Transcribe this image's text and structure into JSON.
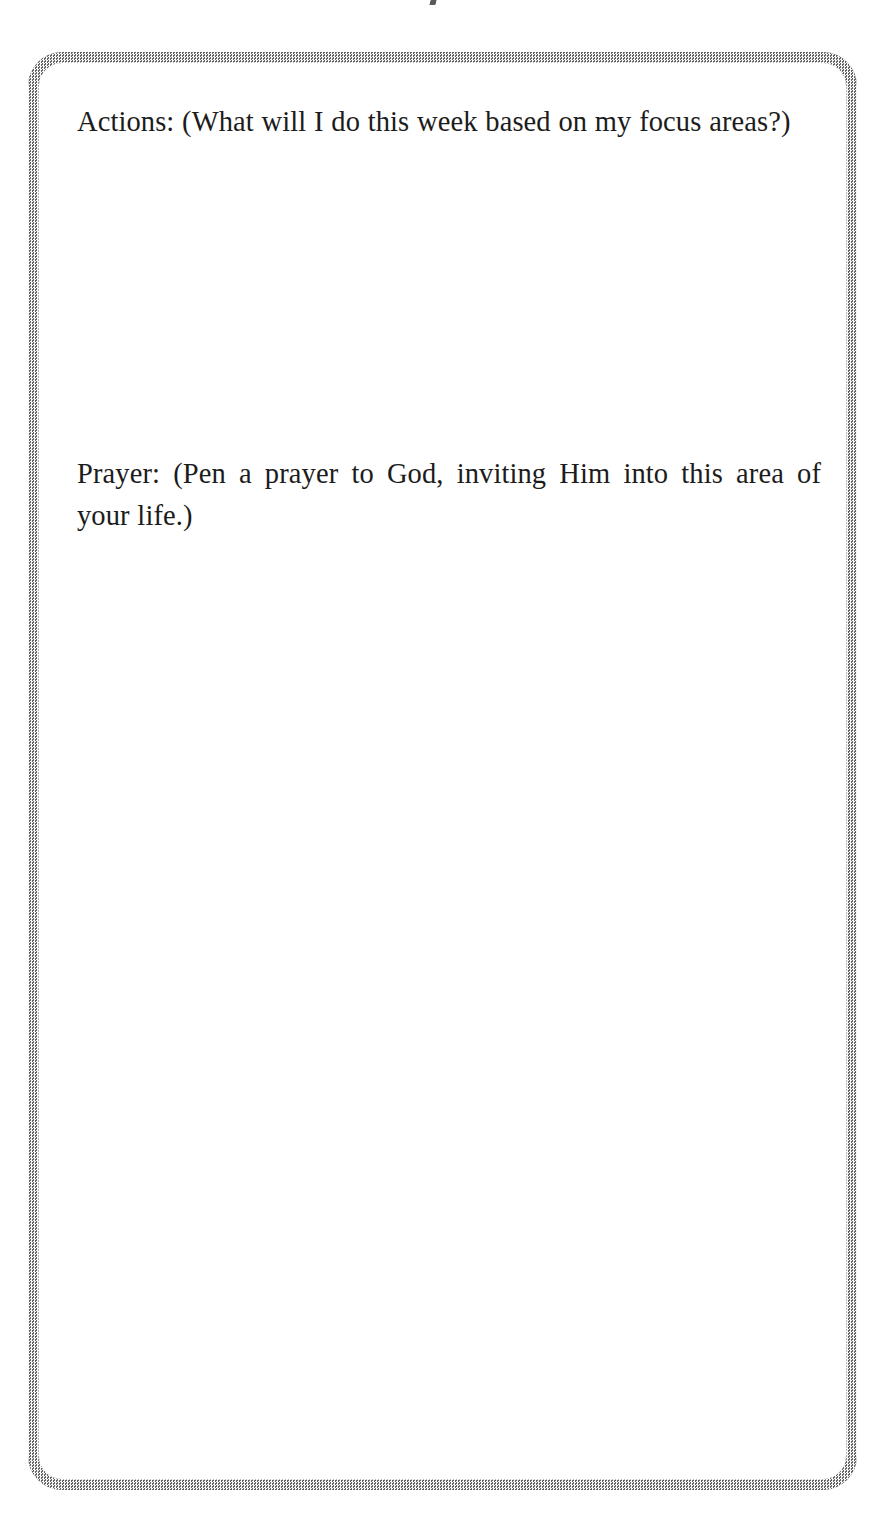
{
  "page": {
    "background_color": "#ffffff",
    "width": 885,
    "height": 1538
  },
  "worksheet": {
    "border_color": "#9a9a9a",
    "border_style": "halftone-dithered-gray",
    "corner_radius_px": 34,
    "sections": [
      {
        "id": "actions",
        "label": "Actions:",
        "prompt": "Actions: (What will I do this week based on my focus areas?)",
        "parenthetical": "(What will I do this week based on my focus areas?)",
        "response": "",
        "response_placeholder": ""
      },
      {
        "id": "prayer",
        "label": "Prayer:",
        "prompt": "Prayer: (Pen a prayer to God, inviting Him into this area of your life.)",
        "parenthetical": "(Pen a prayer to God, inviting Him into this area of your life.)",
        "response": "",
        "response_placeholder": ""
      }
    ]
  },
  "artifacts": {
    "top_scan_mark": ""
  }
}
